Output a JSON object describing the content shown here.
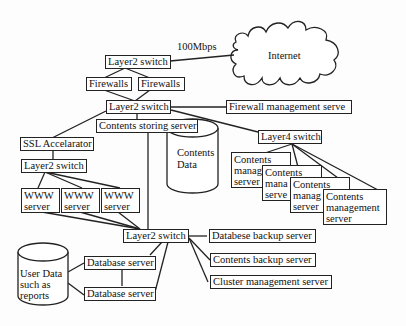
{
  "diagram": {
    "type": "network-architecture",
    "internet": {
      "label": "Internet",
      "link_speed": "100Mbps"
    },
    "nodes": {
      "top_switch": "Layer2 switch",
      "firewall_left": "Firewalls",
      "firewall_right": "Firewalls",
      "core_switch": "Layer2 switch",
      "firewall_mgmt": "Firewall management serve",
      "contents_storing": "Contents storing server",
      "contents_data": {
        "line1": "Contents",
        "line2": "Data"
      },
      "layer4_switch": "Layer4 switch",
      "cms": [
        {
          "line1": "Contents",
          "line2": "manag",
          "line3": "server"
        },
        {
          "line1": "Contents",
          "line2": "mana",
          "line3": "serve"
        },
        {
          "line1": "Contents",
          "line2": "manag",
          "line3": "server"
        },
        {
          "line1": "Contents",
          "line2": "management",
          "line3": "server"
        }
      ],
      "ssl_accelerator": "SSL Accelarator",
      "web_switch": "Layer2 switch",
      "www_servers": [
        {
          "line1": "WWW",
          "line2": "server"
        },
        {
          "line1": "WWW",
          "line2": "server"
        },
        {
          "line1": "WWW",
          "line2": "server"
        }
      ],
      "backend_switch": "Layer2 switch",
      "db_backup": "Databese backup server",
      "contents_backup": "Contents backup server",
      "cluster_mgmt": "Cluster management server",
      "db_server_1": "Database server",
      "db_server_2": "Database server",
      "user_data": {
        "line1": "User Data",
        "line2": "such as",
        "line3": "reports"
      }
    }
  }
}
